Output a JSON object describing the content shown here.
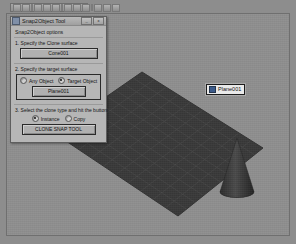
{
  "window": {
    "dialog_title": "Snap2Object Tool",
    "title_icon": "app-icon",
    "minimize_label": "_",
    "close_label": "x"
  },
  "toolbar": {
    "name": "main-toolbar",
    "button_count": 11
  },
  "dialog": {
    "heading": "Snap2Object options",
    "step1": {
      "label": "1. Specify the Clone surface",
      "button": "Cone001"
    },
    "step2": {
      "label": "2. Specify the target surface",
      "radios": [
        {
          "label": "Any Object",
          "selected": false
        },
        {
          "label": "Target Object",
          "selected": true
        }
      ],
      "button": "Plane001"
    },
    "step3": {
      "label": "3. Select the clone type and hit the button",
      "radios": [
        {
          "label": "Instance",
          "selected": true
        },
        {
          "label": "Copy",
          "selected": false
        }
      ],
      "button": "CLONE SNAP TOOL"
    }
  },
  "viewport": {
    "name": "perspective-viewport",
    "background_color": "#8f8f8f",
    "object_label": "Plane001",
    "objects": [
      {
        "name": "Plane001",
        "type": "plane",
        "color": "#3b3b3b"
      },
      {
        "name": "Cone001",
        "type": "cone",
        "color": "#3a3a3a"
      }
    ]
  }
}
